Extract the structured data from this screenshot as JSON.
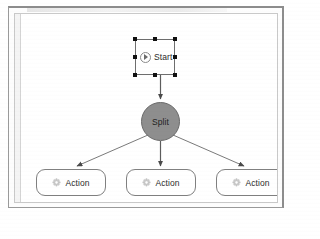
{
  "window": {
    "title": ""
  },
  "canvas": {
    "name": "workflow-canvas"
  },
  "diagram": {
    "type": "workflow-flowchart",
    "nodes": [
      {
        "id": "start",
        "label": "Start",
        "shape": "rectangle",
        "icon": "play-icon",
        "selected": true,
        "fill": "#ffffff",
        "stroke": "#6e6e6e"
      },
      {
        "id": "split",
        "label": "Split",
        "shape": "circle",
        "icon": "",
        "selected": false,
        "fill": "#8e8e8e",
        "stroke": "#6b6b6b"
      },
      {
        "id": "action-1",
        "label": "Action",
        "shape": "rounded-rectangle",
        "icon": "gear-icon",
        "selected": false,
        "fill": "#ffffff",
        "stroke": "#808080"
      },
      {
        "id": "action-2",
        "label": "Action",
        "shape": "rounded-rectangle",
        "icon": "gear-icon",
        "selected": false,
        "fill": "#ffffff",
        "stroke": "#808080"
      },
      {
        "id": "action-3",
        "label": "Action",
        "shape": "rounded-rectangle",
        "icon": "gear-icon",
        "selected": false,
        "fill": "#ffffff",
        "stroke": "#808080"
      }
    ],
    "edges": [
      {
        "id": "edge-start-split",
        "from": "start",
        "to": "split",
        "style": "solid-arrow"
      },
      {
        "id": "edge-split-action-1",
        "from": "split",
        "to": "action-1",
        "style": "solid-arrow"
      },
      {
        "id": "edge-split-action-2",
        "from": "split",
        "to": "action-2",
        "style": "solid-arrow"
      },
      {
        "id": "edge-split-action-3",
        "from": "split",
        "to": "action-3",
        "style": "solid-arrow"
      }
    ],
    "selection_handles": 8,
    "colors": {
      "edge": "#6f6f6f",
      "split_fill": "#8e8e8e",
      "node_stroke": "#808080",
      "canvas_bg": "#ffffff",
      "frame_border": "#9a9a9a"
    }
  }
}
